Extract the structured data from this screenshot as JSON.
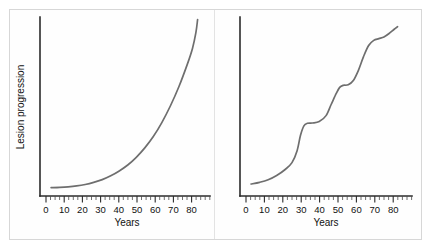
{
  "figure": {
    "background": "#ffffff",
    "frame_color": "#d7d7d7",
    "axis_color": "#2b2b2b",
    "curve_color": "#6e6e6e"
  },
  "axes": {
    "y_label": "Lesion progression",
    "x_label": "Years",
    "x_ticks": [
      0,
      10,
      20,
      30,
      40,
      50,
      60,
      70,
      80
    ],
    "x_tick_labels": [
      "0",
      "10",
      "20",
      "30",
      "40",
      "50",
      "60",
      "70",
      "80"
    ],
    "x_minor_interval": 2.5,
    "x_range": [
      -3,
      88
    ],
    "y_range": [
      0,
      1
    ],
    "y_ticks_shown": false,
    "grid": false
  },
  "chart_data": [
    {
      "type": "line",
      "panel": "left",
      "title": "",
      "subtitle": "",
      "xlabel": "Years",
      "ylabel": "Lesion progression",
      "xlim": [
        -3,
        88
      ],
      "ylim": [
        0,
        1
      ],
      "grid": false,
      "legend": "none",
      "series": [
        {
          "name": "exponential progression",
          "x": [
            0,
            5,
            10,
            15,
            20,
            25,
            30,
            35,
            40,
            45,
            50,
            55,
            60,
            65,
            70,
            75,
            80,
            83,
            85,
            86
          ],
          "values": [
            0.022,
            0.024,
            0.027,
            0.032,
            0.04,
            0.052,
            0.068,
            0.09,
            0.118,
            0.152,
            0.196,
            0.25,
            0.315,
            0.395,
            0.49,
            0.6,
            0.73,
            0.82,
            0.91,
            0.985
          ]
        }
      ],
      "description": "Smooth exponential curve, nearly flat until about year 30 then accelerating steeply to the top of the panel near year 86."
    },
    {
      "type": "line",
      "panel": "right",
      "title": "",
      "subtitle": "",
      "xlabel": "Years",
      "ylabel": "",
      "xlim": [
        -3,
        88
      ],
      "ylim": [
        0,
        1
      ],
      "grid": false,
      "legend": "none",
      "series": [
        {
          "name": "stepwise progression",
          "x": [
            0,
            5,
            10,
            15,
            20,
            24,
            27,
            29,
            31,
            33,
            36,
            40,
            44,
            47,
            50,
            52,
            54,
            57,
            60,
            63,
            66,
            69,
            72,
            75,
            78,
            81,
            84,
            86
          ],
          "values": [
            0.035,
            0.045,
            0.06,
            0.085,
            0.12,
            0.16,
            0.23,
            0.32,
            0.375,
            0.39,
            0.392,
            0.4,
            0.435,
            0.5,
            0.565,
            0.6,
            0.612,
            0.615,
            0.64,
            0.7,
            0.78,
            0.845,
            0.875,
            0.885,
            0.895,
            0.915,
            0.94,
            0.955
          ]
        }
      ],
      "description": "Stepwise / staircase curve with plateaus near years 31-40 and 52-58, separated by rapid rises around years 25-31, 44-52 and 60-72."
    }
  ]
}
